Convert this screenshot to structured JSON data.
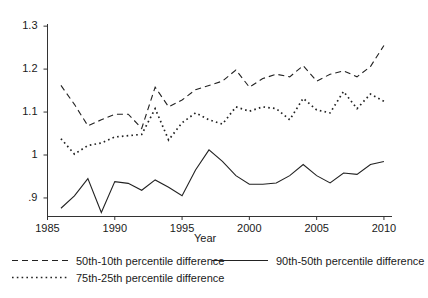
{
  "chart_data": {
    "type": "line",
    "title": "",
    "xlabel": "Year",
    "ylabel": "",
    "xlim": [
      1985,
      2010.6
    ],
    "ylim": [
      0.858,
      1.305
    ],
    "grid": false,
    "legend_position": "below-plot",
    "xticks": [
      1985,
      1990,
      1995,
      2000,
      2005,
      2010
    ],
    "xtick_labels": [
      "1985",
      "1990",
      "1995",
      "2000",
      "2005",
      "2010"
    ],
    "yticks": [
      0.9,
      1.0,
      1.1,
      1.2,
      1.3
    ],
    "ytick_labels": [
      ".9",
      "1",
      "1.1",
      "1.2",
      "1.3"
    ],
    "x": [
      1986,
      1987,
      1988,
      1989,
      1990,
      1991,
      1992,
      1993,
      1994,
      1995,
      1996,
      1997,
      1998,
      1999,
      2000,
      2001,
      2002,
      2003,
      2004,
      2005,
      2006,
      2007,
      2008,
      2009,
      2010
    ],
    "series": [
      {
        "name": "50th-10th percentile difference",
        "style": "dashed",
        "color": "#222222",
        "values": [
          1.162,
          1.118,
          1.068,
          1.082,
          1.095,
          1.095,
          1.062,
          1.158,
          1.112,
          1.128,
          1.152,
          1.162,
          1.172,
          1.198,
          1.158,
          1.178,
          1.188,
          1.182,
          1.208,
          1.172,
          1.188,
          1.196,
          1.182,
          1.206,
          1.255
        ]
      },
      {
        "name": "90th-50th percentile difference",
        "style": "solid",
        "color": "#222222",
        "values": [
          0.876,
          0.905,
          0.945,
          0.866,
          0.938,
          0.934,
          0.918,
          0.942,
          0.925,
          0.905,
          0.965,
          1.012,
          0.985,
          0.952,
          0.932,
          0.932,
          0.935,
          0.952,
          0.978,
          0.952,
          0.935,
          0.958,
          0.955,
          0.978,
          0.985
        ]
      },
      {
        "name": "75th-25th percentile difference",
        "style": "dotted",
        "color": "#222222",
        "values": [
          1.038,
          1.002,
          1.022,
          1.028,
          1.042,
          1.045,
          1.048,
          1.108,
          1.035,
          1.075,
          1.098,
          1.082,
          1.072,
          1.112,
          1.102,
          1.112,
          1.108,
          1.082,
          1.132,
          1.105,
          1.098,
          1.148,
          1.108,
          1.142,
          1.125
        ]
      }
    ]
  },
  "axis": {
    "xlabel": "Year"
  },
  "legend": {
    "items": [
      {
        "label": "50th-10th percentile difference",
        "style": "dashed"
      },
      {
        "label": "90th-50th percentile difference",
        "style": "solid"
      },
      {
        "label": "75th-25th percentile difference",
        "style": "dotted"
      }
    ]
  }
}
